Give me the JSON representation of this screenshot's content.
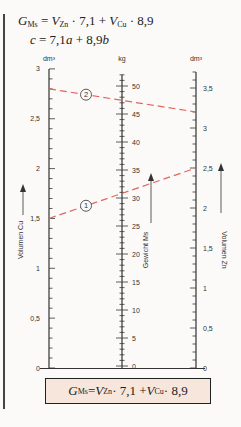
{
  "formula_header": {
    "line1": {
      "G": "G",
      "G_sub": "Ms",
      "eq": " = ",
      "V1": "V",
      "V1_sub": "Zn",
      "mid": " · 7,1 + ",
      "V2": "V",
      "V2_sub": "Cu",
      "end": " · 8,9"
    },
    "line2": {
      "c": "c",
      "rest_a": " = 7,1",
      "a": "a",
      "plus": " + 8,9",
      "b": "b"
    }
  },
  "axes": {
    "left": {
      "unit": "dm³",
      "label": "Volumen  Cu",
      "ticks": [
        "0",
        "0,5",
        "1",
        "1,5",
        "2",
        "2,5",
        "3"
      ]
    },
    "middle": {
      "unit": "kg",
      "label": "Gewicht  Ms",
      "ticks": [
        "0",
        "5",
        "10",
        "15",
        "20",
        "25",
        "30",
        "35",
        "40",
        "45",
        "50"
      ]
    },
    "right": {
      "unit": "dm³",
      "label": "Volumen  Zn",
      "ticks": [
        "0",
        "0,5",
        "1",
        "1,5",
        "2",
        "2,5",
        "3",
        "3,5"
      ]
    }
  },
  "examples": [
    {
      "marker": "1",
      "cu": 1.5,
      "ms": 31.5,
      "zn": 2.5
    },
    {
      "marker": "2",
      "cu": 2.8,
      "ms": 47,
      "zn": 3.2
    }
  ],
  "colors": {
    "axis": "#333333",
    "dash": "#e0675f",
    "box_bg": "#f7e6dc"
  },
  "formula_box": {
    "G": "G",
    "G_sub": "Ms",
    "eq": " = ",
    "V1": "V",
    "V1_sub": "Zn",
    "mid": " · 7,1 + ",
    "V2": "V",
    "V2_sub": "Cu",
    "end": " · 8,9"
  },
  "chart_data": {
    "type": "nomogram",
    "title": "GMs = VZn · 7,1 + VCu · 8,9",
    "subtitle": "c = 7,1a + 8,9b",
    "scales": [
      {
        "name": "Volumen Cu",
        "unit": "dm³",
        "range": [
          0,
          3
        ],
        "major_ticks": [
          0,
          0.5,
          1,
          1.5,
          2,
          2.5,
          3
        ]
      },
      {
        "name": "Gewicht Ms",
        "unit": "kg",
        "range": [
          0,
          52
        ],
        "major_ticks": [
          0,
          5,
          10,
          15,
          20,
          25,
          30,
          35,
          40,
          45,
          50
        ]
      },
      {
        "name": "Volumen Zn",
        "unit": "dm³",
        "range": [
          0,
          3.7
        ],
        "major_ticks": [
          0,
          0.5,
          1,
          1.5,
          2,
          2.5,
          3,
          3.5
        ]
      }
    ],
    "isopleths": [
      {
        "label": "1",
        "Cu_dm3": 1.5,
        "Ms_kg": 31.5,
        "Zn_dm3": 2.5
      },
      {
        "label": "2",
        "Cu_dm3": 2.8,
        "Ms_kg": 47,
        "Zn_dm3": 3.2
      }
    ]
  }
}
